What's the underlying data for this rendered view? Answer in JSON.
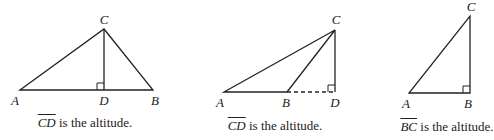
{
  "figures": [
    {
      "id": "acute",
      "vertices": {
        "A": "A",
        "B": "B",
        "C": "C",
        "D": "D"
      },
      "caption": {
        "segment": "CD",
        "text": " is the altitude."
      }
    },
    {
      "id": "obtuse",
      "vertices": {
        "A": "A",
        "B": "B",
        "C": "C",
        "D": "D"
      },
      "caption": {
        "segment": "CD",
        "text": " is the altitude."
      }
    },
    {
      "id": "right",
      "vertices": {
        "A": "A",
        "B": "B",
        "C": "C"
      },
      "caption": {
        "segment": "BC",
        "text": " is the altitude."
      }
    }
  ]
}
